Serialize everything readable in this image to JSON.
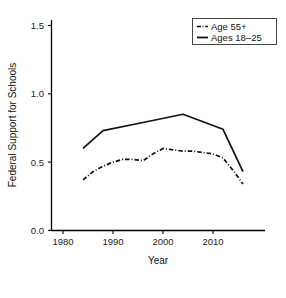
{
  "chart_data": {
    "type": "line",
    "title": "",
    "xlabel": "Year",
    "ylabel": "Federal Support for Schools",
    "xlim": [
      1978,
      2018
    ],
    "ylim": [
      0.0,
      1.5
    ],
    "xticks": [
      1980,
      1990,
      2000,
      2010
    ],
    "xtick_labels": [
      "1980",
      "1990",
      "2000",
      "2010"
    ],
    "yticks": [
      0.0,
      0.5,
      1.0,
      1.5
    ],
    "ytick_labels": [
      "0.0",
      "0.5",
      "1.0",
      "1.5"
    ],
    "grid": false,
    "legend_position": "top-right",
    "series": [
      {
        "name": "Age 55+",
        "style": "dash-dot",
        "color": "#111111",
        "x": [
          1984,
          1986,
          1988,
          1990,
          1992,
          1994,
          1996,
          1998,
          2000,
          2002,
          2004,
          2006,
          2008,
          2010,
          2012,
          2014,
          2016
        ],
        "values": [
          0.37,
          0.43,
          0.47,
          0.5,
          0.52,
          0.52,
          0.51,
          0.56,
          0.6,
          0.59,
          0.58,
          0.58,
          0.57,
          0.56,
          0.53,
          0.44,
          0.34
        ]
      },
      {
        "name": "Ages 18–25",
        "style": "solid",
        "color": "#111111",
        "x": [
          1984,
          1988,
          1996,
          2004,
          2012,
          2016
        ],
        "values": [
          0.6,
          0.73,
          0.79,
          0.85,
          0.74,
          0.43
        ]
      }
    ]
  },
  "axes": {
    "y_label": "Federal Support for Schools",
    "x_label": "Year",
    "y_tick_labels": [
      "1.5",
      "1.0",
      "0.5",
      "0.0"
    ],
    "x_tick_labels": [
      "1980",
      "1990",
      "2000",
      "2010"
    ]
  },
  "legend": {
    "entries": [
      {
        "label": "Age 55+",
        "marker": "dash-dot-line-swatch"
      },
      {
        "label": "Ages 18–25",
        "marker": "solid-line-swatch"
      }
    ]
  }
}
